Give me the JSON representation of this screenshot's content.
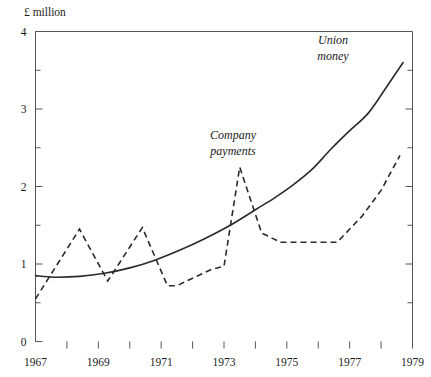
{
  "chart_data": {
    "type": "line",
    "title": "",
    "xlabel": "",
    "ylabel": "£ million",
    "xlim": [
      1967,
      1979
    ],
    "ylim": [
      0,
      4
    ],
    "grid": false,
    "legend_position": "inline-annotation",
    "y_ticks_major": [
      "0",
      "1",
      "2",
      "3",
      "4"
    ],
    "y_tick_values_major": [
      0,
      1,
      2,
      3,
      4
    ],
    "y_tick_values_minor": [
      0.5,
      1.5,
      2.5,
      3.5
    ],
    "x_ticks_major": [
      "1967",
      "1969",
      "1971",
      "1973",
      "1975",
      "1977",
      "1979"
    ],
    "x_tick_values_major": [
      1967,
      1969,
      1971,
      1973,
      1975,
      1977,
      1979
    ],
    "x_tick_values_minor": [
      1968,
      1970,
      1972,
      1974,
      1976,
      1978
    ],
    "series": [
      {
        "name": "Union money",
        "style": "solid",
        "label_line_1": "Union",
        "label_line_2": "money",
        "x": [
          1967.0,
          1967.6,
          1968.4,
          1969.2,
          1970.0,
          1970.8,
          1971.6,
          1972.4,
          1973.2,
          1974.0,
          1974.6,
          1975.2,
          1975.8,
          1976.4,
          1977.0,
          1977.6,
          1978.2,
          1978.7
        ],
        "values": [
          0.85,
          0.83,
          0.84,
          0.88,
          0.95,
          1.05,
          1.18,
          1.33,
          1.5,
          1.7,
          1.85,
          2.02,
          2.22,
          2.48,
          2.72,
          2.95,
          3.3,
          3.6
        ]
      },
      {
        "name": "Company payments",
        "style": "dashed",
        "label_line_1": "Company",
        "label_line_2": "payments",
        "x": [
          1967.0,
          1968.4,
          1969.3,
          1970.4,
          1971.2,
          1971.5,
          1972.6,
          1973.0,
          1973.5,
          1974.2,
          1974.8,
          1975.2,
          1976.6,
          1977.4,
          1978.0,
          1978.6
        ],
        "values": [
          0.55,
          1.45,
          0.78,
          1.47,
          0.72,
          0.72,
          0.93,
          0.97,
          2.25,
          1.4,
          1.28,
          1.28,
          1.28,
          1.62,
          1.95,
          2.4
        ]
      }
    ]
  },
  "axis": {
    "y_title": "£ million"
  }
}
